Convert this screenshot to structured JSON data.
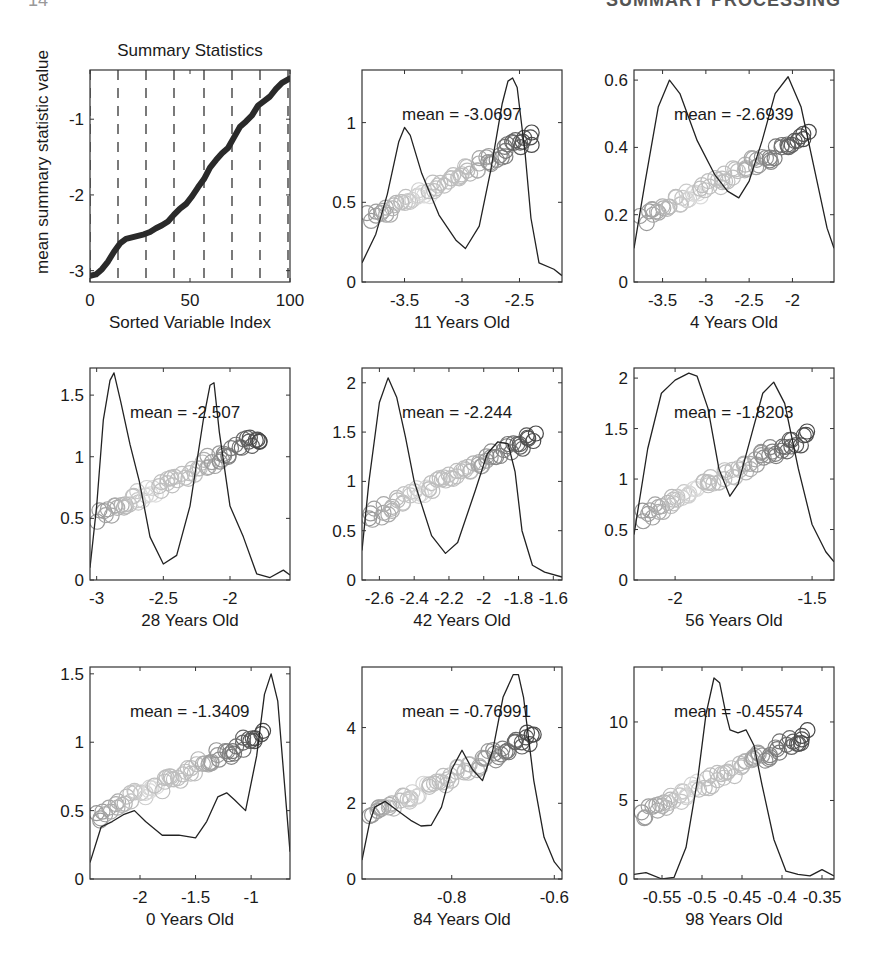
{
  "page": {
    "header_fragment": "SUMMARY PROCESSING",
    "page_number_fragment": "14"
  },
  "chart_data": [
    {
      "id": "summary",
      "type": "line",
      "title": "Summary Statistics",
      "xlabel": "Sorted Variable Index",
      "ylabel": "mean summary statistic value",
      "xlim": [
        0,
        100
      ],
      "ylim": [
        -3.15,
        -0.35
      ],
      "xticks": [
        0,
        50,
        100
      ],
      "xtick_labels": [
        "0",
        "50",
        "100"
      ],
      "yticks": [
        -3,
        -2,
        -1
      ],
      "ytick_labels": [
        "-3",
        "-2",
        "-1"
      ],
      "dashed_vlines": [
        0,
        14,
        28,
        42,
        57,
        71,
        85,
        99
      ],
      "grid": false,
      "x": [
        0,
        3,
        6,
        9,
        12,
        15,
        18,
        21,
        24,
        27,
        30,
        33,
        36,
        39,
        42,
        45,
        48,
        51,
        54,
        57,
        60,
        63,
        66,
        69,
        72,
        75,
        78,
        81,
        84,
        87,
        90,
        93,
        96,
        100
      ],
      "values": [
        -3.07,
        -3.05,
        -2.98,
        -2.88,
        -2.75,
        -2.64,
        -2.58,
        -2.56,
        -2.54,
        -2.52,
        -2.49,
        -2.44,
        -2.4,
        -2.35,
        -2.26,
        -2.18,
        -2.12,
        -2.02,
        -1.9,
        -1.79,
        -1.64,
        -1.54,
        -1.45,
        -1.38,
        -1.24,
        -1.1,
        -1.03,
        -0.95,
        -0.82,
        -0.76,
        -0.7,
        -0.6,
        -0.52,
        -0.46
      ]
    },
    {
      "id": "age11",
      "type": "scatter+density",
      "xlabel": "11 Years Old",
      "annotation": "mean = -3.0697",
      "xlim": [
        -3.87,
        -2.13
      ],
      "ylim": [
        0,
        1.33
      ],
      "xticks": [
        -3.5,
        -3,
        -2.5
      ],
      "xtick_labels": [
        "-3.5",
        "-3",
        "-2.5"
      ],
      "yticks": [
        0,
        0.5,
        1
      ],
      "ytick_labels": [
        "0",
        "0.5",
        "1"
      ],
      "density": {
        "x": [
          -3.87,
          -3.75,
          -3.65,
          -3.55,
          -3.5,
          -3.45,
          -3.35,
          -3.2,
          -3.05,
          -2.97,
          -2.85,
          -2.75,
          -2.65,
          -2.6,
          -2.56,
          -2.52,
          -2.45,
          -2.4,
          -2.33,
          -2.2,
          -2.13
        ],
        "y": [
          0.12,
          0.3,
          0.55,
          0.88,
          0.97,
          0.92,
          0.68,
          0.42,
          0.26,
          0.21,
          0.35,
          0.7,
          1.12,
          1.26,
          1.28,
          1.22,
          0.8,
          0.4,
          0.12,
          0.08,
          0.04
        ]
      },
      "points_summary": "increasing linear trend from (-3.85, 0.42) to (-2.45, 0.90); outlier at (-2.18, 0.88); dark cluster near (-2.5, 0.85)"
    },
    {
      "id": "age4",
      "type": "scatter+density",
      "xlabel": "4 Years Old",
      "annotation": "mean = -2.6939",
      "xlim": [
        -3.83,
        -1.52
      ],
      "ylim": [
        0,
        0.63
      ],
      "xticks": [
        -3.5,
        -3,
        -2.5,
        -2
      ],
      "xtick_labels": [
        "-3.5",
        "-3",
        "-2.5",
        "-2"
      ],
      "yticks": [
        0,
        0.2,
        0.4,
        0.6
      ],
      "ytick_labels": [
        "0",
        "0.2",
        "0.4",
        "0.6"
      ],
      "density": {
        "x": [
          -3.83,
          -3.7,
          -3.55,
          -3.42,
          -3.3,
          -3.1,
          -2.9,
          -2.75,
          -2.62,
          -2.5,
          -2.35,
          -2.2,
          -2.05,
          -1.9,
          -1.75,
          -1.6,
          -1.52
        ],
        "y": [
          0.1,
          0.3,
          0.52,
          0.6,
          0.56,
          0.42,
          0.32,
          0.27,
          0.25,
          0.3,
          0.42,
          0.56,
          0.61,
          0.52,
          0.34,
          0.16,
          0.1
        ]
      },
      "points_summary": "linear trend from (-3.75, 0.20) to (-1.75, 0.44); outlier at (-1.60, 0.41)"
    },
    {
      "id": "age28",
      "type": "scatter+density",
      "xlabel": "28 Years Old",
      "annotation": "mean = -2.507",
      "xlim": [
        -3.05,
        -1.55
      ],
      "ylim": [
        0,
        1.72
      ],
      "xticks": [
        -3,
        -2.5,
        -2
      ],
      "xtick_labels": [
        "-3",
        "-2.5",
        "-2"
      ],
      "yticks": [
        0,
        0.5,
        1,
        1.5
      ],
      "ytick_labels": [
        "0",
        "0.5",
        "1",
        "1.5"
      ],
      "density": {
        "x": [
          -3.05,
          -3.0,
          -2.95,
          -2.9,
          -2.87,
          -2.82,
          -2.75,
          -2.68,
          -2.6,
          -2.5,
          -2.4,
          -2.3,
          -2.2,
          -2.15,
          -2.12,
          -2.08,
          -2.0,
          -1.9,
          -1.8,
          -1.7,
          -1.6,
          -1.55
        ],
        "y": [
          0.1,
          0.6,
          1.3,
          1.62,
          1.68,
          1.45,
          1.1,
          0.8,
          0.35,
          0.13,
          0.2,
          0.6,
          1.3,
          1.58,
          1.6,
          1.2,
          0.6,
          0.35,
          0.05,
          0.02,
          0.08,
          0.04
        ]
      },
      "points_summary": "two bands: upper trend from (-2.95, 0.75) to (-1.85, 1.00), lower band (-3.0..-2.7, 0.55-0.62); dark cluster near (-2.15, 1.1-1.2); outlier at (-1.62, 1.15)"
    },
    {
      "id": "age42",
      "type": "scatter+density",
      "xlabel": "42 Years Old",
      "annotation": "mean = -2.244",
      "xlim": [
        -2.7,
        -1.55
      ],
      "ylim": [
        0,
        2.15
      ],
      "xticks": [
        -2.6,
        -2.4,
        -2.2,
        -2,
        -1.8,
        -1.6
      ],
      "xtick_labels": [
        "-2.6",
        "-2.4",
        "-2.2",
        "-2",
        "-1.8",
        "-1.6"
      ],
      "yticks": [
        0,
        0.5,
        1,
        1.5,
        2
      ],
      "ytick_labels": [
        "0",
        "0.5",
        "1",
        "1.5",
        "2"
      ],
      "density": {
        "x": [
          -2.7,
          -2.66,
          -2.6,
          -2.55,
          -2.5,
          -2.45,
          -2.4,
          -2.3,
          -2.22,
          -2.15,
          -2.05,
          -1.98,
          -1.92,
          -1.86,
          -1.82,
          -1.78,
          -1.72,
          -1.65,
          -1.55
        ],
        "y": [
          0.3,
          1.0,
          1.8,
          2.05,
          1.85,
          1.45,
          1.0,
          0.45,
          0.27,
          0.38,
          0.9,
          1.28,
          1.4,
          1.38,
          1.1,
          0.5,
          0.15,
          0.08,
          0.03
        ]
      },
      "points_summary": "trend from (-2.65, 0.65) to (-2.0, 1.25); dark cluster near (-1.9, 1.35); outlier at (-1.6, 1.4)"
    },
    {
      "id": "age56",
      "type": "scatter+density",
      "xlabel": "56 Years Old",
      "annotation": "mean = -1.8203",
      "xlim": [
        -2.15,
        -1.42
      ],
      "ylim": [
        0,
        2.1
      ],
      "xticks": [
        -2,
        -1.5
      ],
      "xtick_labels": [
        "-2",
        "-1.5"
      ],
      "yticks": [
        0,
        0.5,
        1,
        1.5,
        2
      ],
      "ytick_labels": [
        "0",
        "0.5",
        "1",
        "1.5",
        "2"
      ],
      "density": {
        "x": [
          -2.15,
          -2.1,
          -2.05,
          -2.0,
          -1.95,
          -1.92,
          -1.88,
          -1.84,
          -1.8,
          -1.77,
          -1.72,
          -1.68,
          -1.64,
          -1.6,
          -1.55,
          -1.5,
          -1.45,
          -1.42
        ],
        "y": [
          0.45,
          1.3,
          1.85,
          1.98,
          2.05,
          2.02,
          1.7,
          1.1,
          0.83,
          0.95,
          1.45,
          1.85,
          1.96,
          1.75,
          1.1,
          0.55,
          0.28,
          0.18
        ]
      },
      "points_summary": "trend from (-2.12, 0.68) to (-1.6, 1.3); scatter of dark points near (-1.6, 1.3-1.5); outlier at (-1.45, 1.4)"
    },
    {
      "id": "age0",
      "type": "scatter+density",
      "xlabel": "0 Years Old",
      "annotation": "mean = -1.3409",
      "xlim": [
        -2.45,
        -0.65
      ],
      "ylim": [
        0,
        1.55
      ],
      "xticks": [
        -2,
        -1.5,
        -1
      ],
      "xtick_labels": [
        "-2",
        "-1.5",
        "-1"
      ],
      "yticks": [
        0,
        0.5,
        1,
        1.5
      ],
      "ytick_labels": [
        "0",
        "0.5",
        "1",
        "1.5"
      ],
      "density": {
        "x": [
          -2.45,
          -2.35,
          -2.25,
          -2.15,
          -2.05,
          -1.95,
          -1.8,
          -1.65,
          -1.5,
          -1.4,
          -1.3,
          -1.22,
          -1.15,
          -1.05,
          -0.95,
          -0.88,
          -0.82,
          -0.76,
          -0.7,
          -0.65
        ],
        "y": [
          0.12,
          0.38,
          0.42,
          0.47,
          0.5,
          0.42,
          0.32,
          0.32,
          0.3,
          0.42,
          0.6,
          0.63,
          0.58,
          0.5,
          0.9,
          1.35,
          1.5,
          1.3,
          0.7,
          0.2
        ]
      },
      "points_summary": "trend from (-2.4, 0.48) to (-0.95, 0.88); dark cluster near (-0.8, 0.95-1.05)"
    },
    {
      "id": "age84",
      "type": "scatter+density",
      "xlabel": "84 Years Old",
      "annotation": "mean = -0.76991",
      "xlim": [
        -0.975,
        -0.585
      ],
      "ylim": [
        0,
        5.6
      ],
      "xticks": [
        -0.8,
        -0.6
      ],
      "xtick_labels": [
        "-0.8",
        "-0.6"
      ],
      "yticks": [
        0,
        2,
        4
      ],
      "ytick_labels": [
        "0",
        "2",
        "4"
      ],
      "density": {
        "x": [
          -0.975,
          -0.96,
          -0.95,
          -0.93,
          -0.91,
          -0.88,
          -0.86,
          -0.84,
          -0.82,
          -0.8,
          -0.78,
          -0.76,
          -0.74,
          -0.72,
          -0.7,
          -0.68,
          -0.67,
          -0.66,
          -0.64,
          -0.62,
          -0.6,
          -0.585
        ],
        "y": [
          0.5,
          1.5,
          1.9,
          2.05,
          1.85,
          1.55,
          1.4,
          1.42,
          1.9,
          2.9,
          3.4,
          2.9,
          2.6,
          3.4,
          4.8,
          5.4,
          5.4,
          4.8,
          2.6,
          1.1,
          0.45,
          0.2
        ]
      },
      "points_summary": "trend from (-0.96, 1.8) to (-0.66, 3.9); outliers at (-0.6, 3.2)"
    },
    {
      "id": "age98",
      "type": "scatter+density",
      "xlabel": "98 Years Old",
      "annotation": "mean = -0.45574",
      "xlim": [
        -0.585,
        -0.335
      ],
      "ylim": [
        0,
        13.5
      ],
      "xticks": [
        -0.55,
        -0.5,
        -0.45,
        -0.4,
        -0.35
      ],
      "xtick_labels": [
        "-0.55",
        "-0.5",
        "-0.45",
        "-0.4",
        "-0.35"
      ],
      "yticks": [
        0,
        5,
        10
      ],
      "ytick_labels": [
        "0",
        "5",
        "10"
      ],
      "density": {
        "x": [
          -0.585,
          -0.57,
          -0.55,
          -0.535,
          -0.52,
          -0.505,
          -0.495,
          -0.485,
          -0.478,
          -0.47,
          -0.465,
          -0.455,
          -0.445,
          -0.435,
          -0.425,
          -0.41,
          -0.395,
          -0.38,
          -0.365,
          -0.35,
          -0.335
        ],
        "y": [
          0.3,
          0.4,
          0.0,
          0.1,
          2.0,
          6.5,
          10.5,
          12.8,
          12.5,
          10.5,
          9.5,
          9.3,
          9.5,
          8.5,
          6.0,
          2.5,
          0.5,
          0.3,
          0.2,
          0.6,
          0.2
        ]
      },
      "points_summary": "two clusters: dark cluster at (-0.5..-0.47, 8-9.5), lower/grey trend from (-0.5, 4.2) to (-0.43, 7); outliers at (-0.575, 9.5), (-0.35, 7.7)"
    }
  ]
}
